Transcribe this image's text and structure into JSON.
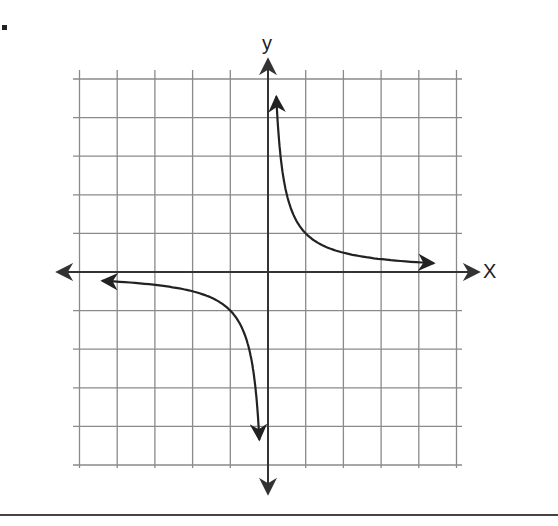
{
  "problem": {
    "bullet": "."
  },
  "chart_data": {
    "type": "line",
    "title": "",
    "function": "y = 1/x",
    "xlabel": "X",
    "ylabel": "y",
    "xlim": [
      -5,
      5
    ],
    "ylim": [
      -5,
      5
    ],
    "grid": true,
    "grid_step": 1,
    "tick_labels": false,
    "series": [
      {
        "name": "branch-positive",
        "x": [
          0.22,
          0.25,
          0.33,
          0.5,
          0.75,
          1,
          1.5,
          2,
          3,
          4,
          4.4
        ],
        "y": [
          4.5,
          4,
          3,
          2,
          1.33,
          1,
          0.67,
          0.5,
          0.33,
          0.25,
          0.23
        ],
        "arrows": "both"
      },
      {
        "name": "branch-negative",
        "x": [
          -4.4,
          -4,
          -3,
          -2,
          -1.5,
          -1,
          -0.75,
          -0.5,
          -0.33,
          -0.25,
          -0.23
        ],
        "y": [
          -0.23,
          -0.25,
          -0.33,
          -0.5,
          -0.67,
          -1,
          -1.33,
          -2,
          -3,
          -4,
          -4.3
        ],
        "arrows": "both"
      }
    ],
    "colors": {
      "grid": "#8a8a8a",
      "axes": "#333333",
      "curve": "#222222"
    }
  }
}
